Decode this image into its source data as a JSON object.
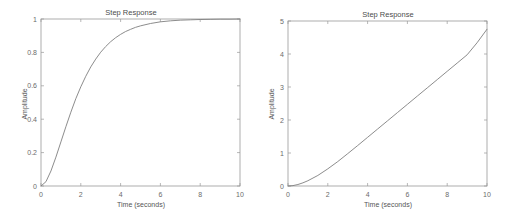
{
  "figure": {
    "background_color": "#ffffff",
    "axis_color": "#9a9a9a",
    "line_color": "#7f7f7f",
    "text_color": "#555555"
  },
  "chart_data": [
    {
      "id": "left",
      "type": "line",
      "title": "Step Response",
      "xlabel": "Time (seconds)",
      "ylabel": "Amplitude",
      "xlim": [
        0,
        10
      ],
      "ylim": [
        0,
        1
      ],
      "xticks": [
        0,
        2,
        4,
        6,
        8,
        10
      ],
      "xticklabels": [
        "0",
        "2",
        "4",
        "6",
        "8",
        "10"
      ],
      "yticks": [
        0,
        0.2,
        0.4,
        0.6,
        0.8,
        1
      ],
      "yticklabels": [
        "0",
        "0.2",
        "0.4",
        "0.6",
        "0.8",
        "1"
      ],
      "grid": false,
      "legend": null,
      "box": true,
      "series": [
        {
          "name": "Step Response",
          "x": [
            0,
            0.25,
            0.5,
            0.75,
            1,
            1.25,
            1.5,
            1.75,
            2,
            2.25,
            2.5,
            2.75,
            3,
            3.25,
            3.5,
            3.75,
            4,
            4.25,
            4.5,
            4.75,
            5,
            5.5,
            6,
            6.5,
            7,
            7.5,
            8,
            8.5,
            9,
            9.5,
            10
          ],
          "y": [
            0,
            0.026,
            0.09,
            0.173,
            0.264,
            0.355,
            0.442,
            0.523,
            0.594,
            0.657,
            0.713,
            0.76,
            0.801,
            0.835,
            0.864,
            0.888,
            0.908,
            0.925,
            0.938,
            0.95,
            0.959,
            0.973,
            0.983,
            0.989,
            0.993,
            0.995,
            0.997,
            0.998,
            0.999,
            0.999,
            1.0
          ]
        }
      ]
    },
    {
      "id": "right",
      "type": "line",
      "title": "Step Response",
      "xlabel": "Time (seconds)",
      "ylabel": "Amplitude",
      "xlim": [
        0,
        10
      ],
      "ylim": [
        0,
        5
      ],
      "xticks": [
        0,
        2,
        4,
        6,
        8,
        10
      ],
      "xticklabels": [
        "0",
        "2",
        "4",
        "6",
        "8",
        "10"
      ],
      "yticks": [
        0,
        1,
        2,
        3,
        4,
        5
      ],
      "yticklabels": [
        "0",
        "1",
        "2",
        "3",
        "4",
        "5"
      ],
      "grid": false,
      "legend": null,
      "box": true,
      "series": [
        {
          "name": "Step Response",
          "x": [
            0,
            0.25,
            0.5,
            0.75,
            1,
            1.5,
            2,
            2.5,
            3,
            3.5,
            4,
            4.5,
            5,
            5.5,
            6,
            6.5,
            7,
            7.5,
            8,
            8.5,
            9,
            9.5,
            10
          ],
          "y": [
            0,
            0.012,
            0.045,
            0.096,
            0.16,
            0.32,
            0.52,
            0.74,
            0.98,
            1.225,
            1.475,
            1.725,
            1.975,
            2.225,
            2.475,
            2.725,
            2.975,
            3.225,
            3.475,
            3.725,
            3.975,
            4.34,
            4.75
          ]
        }
      ]
    }
  ]
}
